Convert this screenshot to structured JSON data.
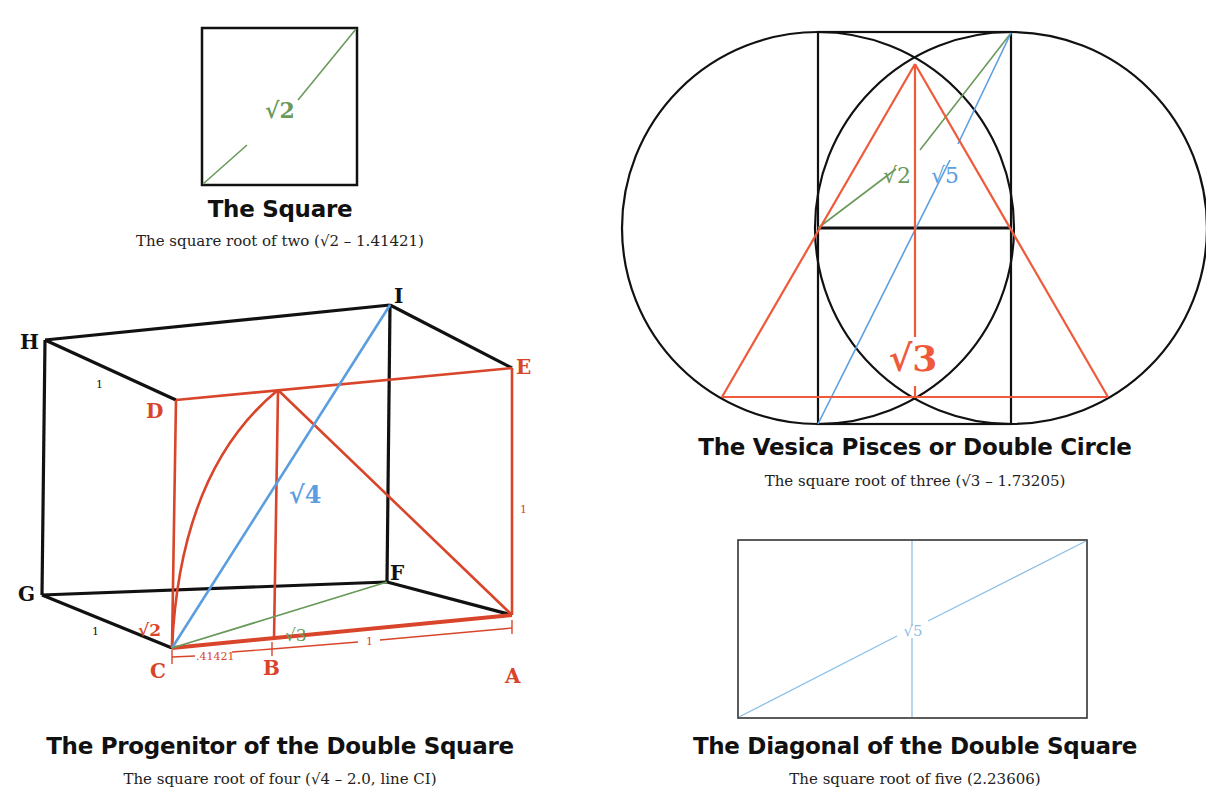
{
  "colors": {
    "black": "#111111",
    "red": "#d9452b",
    "orange_red": "#ee5a3a",
    "green": "#6a9a5a",
    "blue": "#5b9ee0",
    "light_blue": "#8cc0e8"
  },
  "figures": {
    "square": {
      "title": "The Square",
      "subtitle": "The square root of two (√2 – 1.41421)",
      "diagonal_label": "√2"
    },
    "progenitor": {
      "title": "The Progenitor of the Double Square",
      "subtitle": "The square root of four (√4 – 2.0, line CI)",
      "vertex_labels": {
        "H": "H",
        "I": "I",
        "E": "E",
        "D": "D",
        "G": "G",
        "F": "F",
        "C": "C",
        "A": "A",
        "B": "B"
      },
      "edge_labels": {
        "hd": "1",
        "ea": "1",
        "gc": "1",
        "ca": "1",
        "cb": ".41421",
        "root2": "√2",
        "root3": "√3",
        "root4": "√4"
      }
    },
    "vesica": {
      "title": "The Vesica Pisces or Double Circle",
      "subtitle": "The square root of three (√3 – 1.73205)",
      "labels": {
        "root2": "√2",
        "root5": "√5",
        "root3": "√3"
      }
    },
    "double_square": {
      "title": "The Diagonal of the Double Square",
      "subtitle": "The square root of five (2.23606)",
      "diagonal_label": "√5"
    }
  }
}
